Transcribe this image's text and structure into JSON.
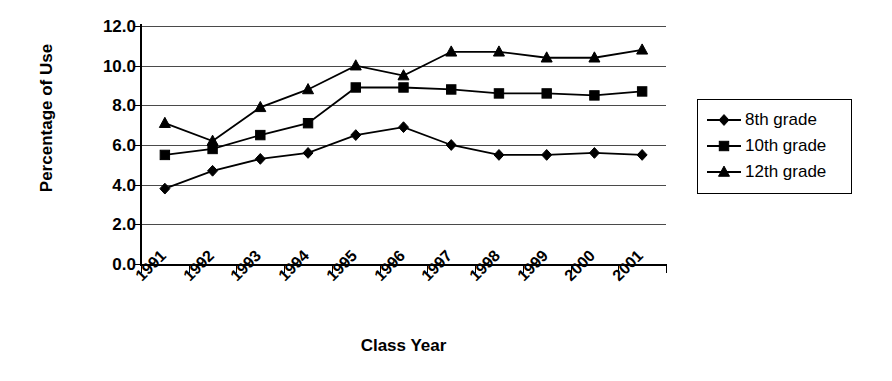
{
  "chart_data": {
    "type": "line",
    "title": "",
    "xlabel": "Class Year",
    "ylabel": "Percentage of Use",
    "categories": [
      "1991",
      "1992",
      "1993",
      "1994",
      "1995",
      "1996",
      "1997",
      "1998",
      "1999",
      "2000",
      "2001"
    ],
    "ylim": [
      0.0,
      12.0
    ],
    "ytick_values": [
      0.0,
      2.0,
      4.0,
      6.0,
      8.0,
      10.0,
      12.0
    ],
    "ytick_labels": [
      "0.0",
      "2.0",
      "4.0",
      "6.0",
      "8.0",
      "10.0",
      "12.0"
    ],
    "grid": true,
    "legend_position": "right",
    "series": [
      {
        "name": "8th grade",
        "marker": "diamond",
        "color": "#000000",
        "values": [
          3.8,
          4.7,
          5.3,
          5.6,
          6.5,
          6.9,
          6.0,
          5.5,
          5.5,
          5.6,
          5.5
        ]
      },
      {
        "name": "10th grade",
        "marker": "square",
        "color": "#000000",
        "values": [
          5.5,
          5.8,
          6.5,
          7.1,
          8.9,
          8.9,
          8.8,
          8.6,
          8.6,
          8.5,
          8.7
        ]
      },
      {
        "name": "12th grade",
        "marker": "triangle",
        "color": "#000000",
        "values": [
          7.1,
          6.2,
          7.9,
          8.8,
          10.0,
          9.5,
          10.7,
          10.7,
          10.4,
          10.4,
          10.8
        ]
      }
    ]
  },
  "legend": {
    "items": [
      {
        "label": "8th grade",
        "marker": "diamond-marker-icon"
      },
      {
        "label": "10th grade",
        "marker": "square-marker-icon"
      },
      {
        "label": "12th grade",
        "marker": "triangle-marker-icon"
      }
    ]
  },
  "axes": {
    "y_title": "Percentage of Use",
    "x_title": "Class Year"
  }
}
